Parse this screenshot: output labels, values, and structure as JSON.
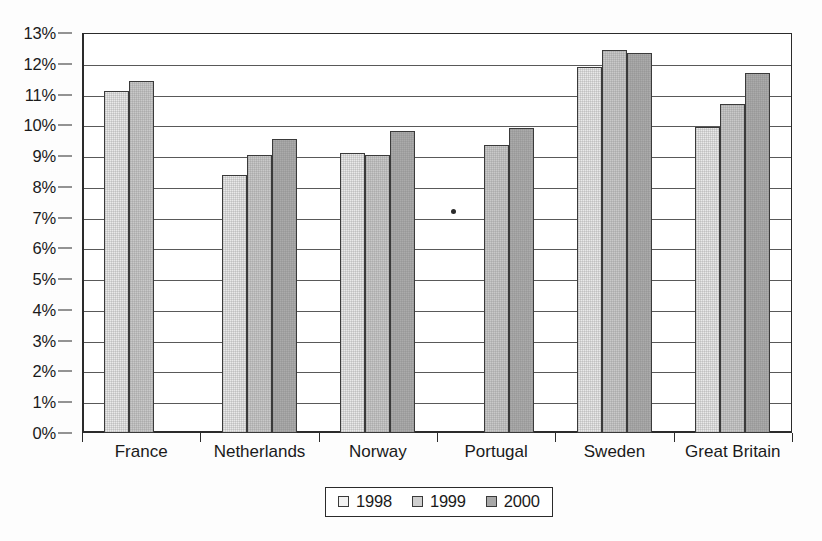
{
  "chart_data": {
    "type": "bar",
    "title": "",
    "subtitle": "",
    "xlabel": "",
    "ylabel": "",
    "ylim": [
      0,
      13
    ],
    "y_tick_step": 1,
    "grid": true,
    "legend_position": "bottom",
    "categories": [
      "France",
      "Netherlands",
      "Norway",
      "Portugal",
      "Sweden",
      "Great Britain"
    ],
    "y_tick_labels": [
      "0%",
      "1%",
      "2%",
      "3%",
      "4%",
      "5%",
      "6%",
      "7%",
      "8%",
      "9%",
      "10%",
      "11%",
      "12%",
      "13%"
    ],
    "series": [
      {
        "name": "1998",
        "color": "#e9e9e9",
        "values": [
          11.1,
          8.4,
          9.1,
          null,
          11.9,
          9.95
        ]
      },
      {
        "name": "1999",
        "color": "#c9c9c9",
        "values": [
          11.45,
          9.05,
          9.05,
          9.35,
          12.45,
          10.7
        ]
      },
      {
        "name": "2000",
        "color": "#ababab",
        "values": [
          null,
          9.55,
          9.8,
          9.9,
          12.35,
          11.7
        ]
      }
    ]
  },
  "legend": {
    "entries": [
      {
        "label": "1998",
        "swatch": "legend-swatch-1998"
      },
      {
        "label": "1999",
        "swatch": "legend-swatch-1999"
      },
      {
        "label": "2000",
        "swatch": "legend-swatch-2000"
      }
    ]
  },
  "colors": {
    "series_1998": "#e9e9e9",
    "series_1999": "#c9c9c9",
    "series_2000": "#ababab",
    "axis": "#2b2b2b",
    "gridline": "#595959",
    "background": "#fdfdfd"
  }
}
